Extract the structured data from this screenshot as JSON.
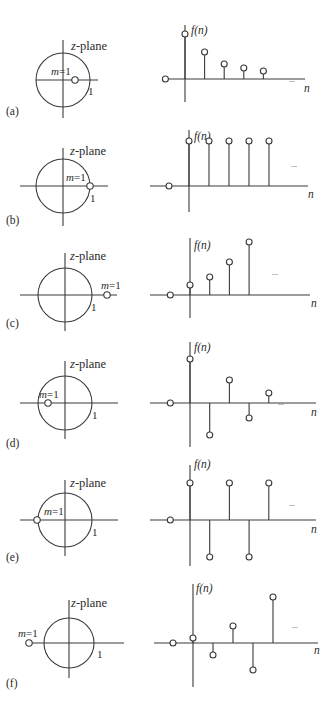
{
  "figure": {
    "labels": {
      "zplane": "z-plane",
      "pole": "m = 1",
      "unit": "1",
      "fn": "f(n)",
      "n": "n",
      "ellipsis": "..."
    },
    "panels": [
      {
        "id": "a",
        "caption": "(a)",
        "pole_position": "inside unit circle, positive real axis (0 < m < 1)"
      },
      {
        "id": "b",
        "caption": "(b)",
        "pole_position": "on unit circle at z = 1"
      },
      {
        "id": "c",
        "caption": "(c)",
        "pole_position": "outside unit circle, positive real axis (m > 1)"
      },
      {
        "id": "d",
        "caption": "(d)",
        "pole_position": "inside unit circle, negative real axis (-1 < m < 0)"
      },
      {
        "id": "e",
        "caption": "(e)",
        "pole_position": "on unit circle at z = -1"
      },
      {
        "id": "f",
        "caption": "(f)",
        "pole_position": "outside unit circle, negative real axis (m < -1)"
      }
    ]
  },
  "chart_data": [
    {
      "type": "stem",
      "panel": "a",
      "title": "(a)",
      "xlabel": "n",
      "ylabel": "f(n)",
      "x": [
        -1,
        0,
        1,
        2,
        3,
        4
      ],
      "values": [
        0,
        45,
        27,
        15,
        11,
        8
      ],
      "annotation": "decaying sequence, continues ..."
    },
    {
      "type": "stem",
      "panel": "b",
      "title": "(b)",
      "xlabel": "n",
      "ylabel": "f(n)",
      "x": [
        -1,
        0,
        1,
        2,
        3,
        4
      ],
      "values": [
        0,
        45,
        45,
        45,
        45,
        45
      ],
      "annotation": "constant sequence, continues ..."
    },
    {
      "type": "stem",
      "panel": "c",
      "title": "(c)",
      "xlabel": "n",
      "ylabel": "f(n)",
      "x": [
        -1,
        0,
        1,
        2,
        3
      ],
      "values": [
        0,
        10,
        18,
        33,
        53
      ],
      "annotation": "growing sequence, continues ..."
    },
    {
      "type": "stem",
      "panel": "d",
      "title": "(d)",
      "xlabel": "n",
      "ylabel": "f(n)",
      "x": [
        -1,
        0,
        1,
        2,
        3,
        4
      ],
      "values": [
        0,
        44,
        -32,
        23,
        -15,
        10
      ],
      "annotation": "alternating decaying sequence, continues ..."
    },
    {
      "type": "stem",
      "panel": "e",
      "title": "(e)",
      "xlabel": "n",
      "ylabel": "f(n)",
      "x": [
        -1,
        0,
        1,
        2,
        3,
        4
      ],
      "values": [
        0,
        37,
        -37,
        37,
        -37,
        37
      ],
      "annotation": "alternating constant-magnitude sequence, continues ..."
    },
    {
      "type": "stem",
      "panel": "f",
      "title": "(f)",
      "xlabel": "n",
      "ylabel": "f(n)",
      "x": [
        -1,
        0,
        1,
        2,
        3,
        4
      ],
      "values": [
        0,
        5,
        -12,
        17,
        -27,
        46
      ],
      "annotation": "alternating growing sequence, continues ..."
    }
  ]
}
